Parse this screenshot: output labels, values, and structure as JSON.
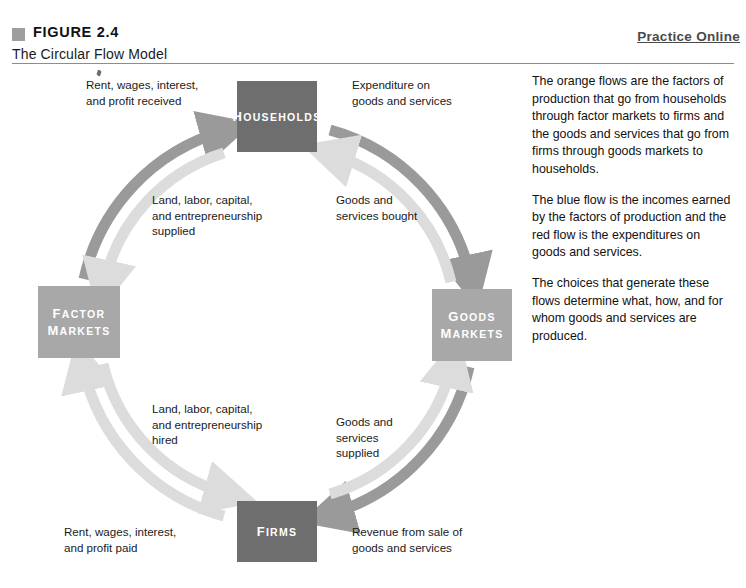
{
  "header": {
    "figure_number": "FIGURE 2.4",
    "figure_title": "The Circular Flow Model",
    "practice_link": "Practice Online"
  },
  "diagram": {
    "title": "The Circular Flow Model",
    "sectors": [
      {
        "id": "households",
        "label_line1": "H",
        "label_rest1": "OUSEHOLDS",
        "color": "#6e6e6e"
      },
      {
        "id": "firms",
        "label_line1": "F",
        "label_rest1": "IRMS",
        "color": "#6e6e6e"
      },
      {
        "id": "factor-markets",
        "label_line1": "F",
        "label_rest1": "ACTOR",
        "label_line2": "M",
        "label_rest2": "ARKETS",
        "color": "#a8a8a8"
      },
      {
        "id": "goods-markets",
        "label_line1": "G",
        "label_rest1": "OODS",
        "label_line2": "M",
        "label_rest2": "ARKETS",
        "color": "#a8a8a8"
      }
    ],
    "flow_labels": {
      "rent_wages_received": "Rent, wages, interest,\nand profit received",
      "expenditure_on_goods": "Expenditure on\ngoods and services",
      "land_labor_supplied": "Land, labor, capital,\nand entrepreneurship\nsupplied",
      "goods_services_bought": "Goods and\nservices bought",
      "land_labor_hired": "Land, labor, capital,\nand entrepreneurship\nhired",
      "goods_services_supplied": "Goods and\nservices\nsupplied",
      "rent_wages_paid": "Rent, wages, interest,\nand profit paid",
      "revenue_from_sale": "Revenue from sale of\ngoods and services"
    },
    "colors": {
      "outer_flow": "#9a9a9a",
      "inner_flow": "#dcdcdc",
      "sector_dark": "#6e6e6e",
      "sector_light": "#a8a8a8",
      "rule": "#8d8d8d",
      "marker": "#9e9e9e"
    }
  },
  "commentary": {
    "paragraphs": [
      "The orange flows are the factors of production that go from households through factor markets to firms and the goods and services that go from firms through goods markets to households.",
      "The blue flow is the incomes earned by the factors of production and the red flow is the expenditures on goods and services.",
      "The choices that generate these flows determine what, how, and for whom goods and services are produced."
    ]
  }
}
